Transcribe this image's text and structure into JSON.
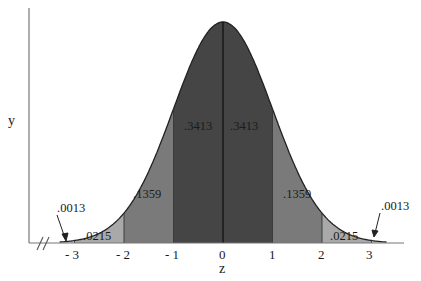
{
  "chart_data": {
    "type": "area",
    "title": "",
    "xlabel": "z",
    "ylabel": "y",
    "x_ticks": [
      -3,
      -2,
      -1,
      0,
      1,
      2,
      3
    ],
    "x_tick_labels": [
      "- 3",
      "- 2",
      "- 1",
      "0",
      "1",
      "2",
      "3"
    ],
    "distribution": "standard normal",
    "regions": [
      {
        "from": -4,
        "to": -3,
        "area": ".0013",
        "shade": "#d4d4d4"
      },
      {
        "from": -3,
        "to": -2,
        "area": ".0215",
        "shade": "#a9a9a9"
      },
      {
        "from": -2,
        "to": -1,
        "area": ".1359",
        "shade": "#7a7a7a"
      },
      {
        "from": -1,
        "to": 0,
        "area": ".3413",
        "shade": "#454545"
      },
      {
        "from": 0,
        "to": 1,
        "area": ".3413",
        "shade": "#454545"
      },
      {
        "from": 1,
        "to": 2,
        "area": ".1359",
        "shade": "#7a7a7a"
      },
      {
        "from": 2,
        "to": 3,
        "area": ".0215",
        "shade": "#a9a9a9"
      },
      {
        "from": 3,
        "to": 4,
        "area": ".0013",
        "shade": "#d4d4d4"
      }
    ],
    "annotations": [
      {
        "text": ".0013",
        "side": "left",
        "arrow": true
      },
      {
        "text": ".0013",
        "side": "right",
        "arrow": true
      }
    ],
    "axis_break": "//",
    "grid": false,
    "legend": "none"
  },
  "labels": {
    "y_axis": "y",
    "x_axis": "z",
    "break_mark": "//",
    "tick_m3": "- 3",
    "tick_m2": "- 2",
    "tick_m1": "- 1",
    "tick_0": "0",
    "tick_1": "1",
    "tick_2": "2",
    "tick_3": "3",
    "area_m4_m3": ".0013",
    "area_m3_m2": ".0215",
    "area_m2_m1": ".1359",
    "area_m1_0": ".3413",
    "area_0_1": ".3413",
    "area_1_2": ".1359",
    "area_2_3": ".0215",
    "area_3_4": ".0013"
  }
}
